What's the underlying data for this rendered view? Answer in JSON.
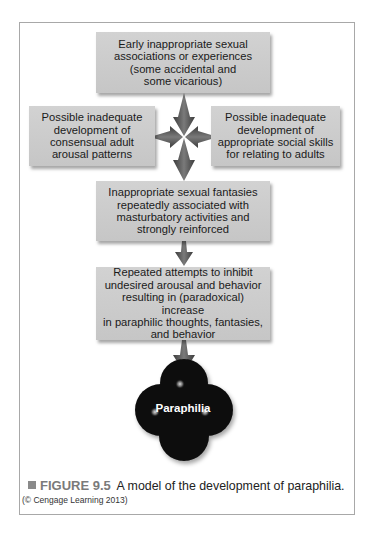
{
  "figure": {
    "boxes": [
      {
        "id": "early",
        "text": "Early inappropriate sexual\nassociations or experiences\n(some accidental and\nsome vicarious)"
      },
      {
        "id": "left",
        "text": "Possible inadequate\ndevelopment of\nconsensual adult\narousal patterns"
      },
      {
        "id": "right",
        "text": "Possible inadequate\ndevelopment of\nappropriate social skills\nfor relating to adults"
      },
      {
        "id": "fantasies",
        "text": "Inappropriate sexual fantasies\nrepeatedly associated with\nmasturbatory activities and\nstrongly reinforced"
      },
      {
        "id": "inhibit",
        "text": "Repeated attempts to inhibit\nundesired arousal and behavior\nresulting in (paradoxical) increase\nin paraphilic thoughts, fantasies,\nand behavior"
      }
    ],
    "outcome": "Paraphilia",
    "caption": {
      "label": "FIGURE 9.5",
      "text": "A model of the development of paraphilia.",
      "credit": "(© Cengage Learning 2013)"
    },
    "colors": {
      "box_fill": "#cccccc",
      "arrow": "#555555",
      "outcome_fill": "#0a0a0a",
      "caption_label": "#7a7a7a"
    }
  }
}
